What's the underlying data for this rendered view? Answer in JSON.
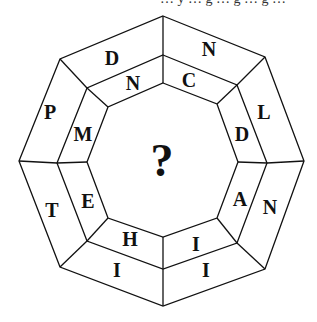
{
  "top_text": "… y … g … g … g …",
  "center": "?",
  "outer_ring": [
    {
      "pos": "top-right",
      "letter": "N"
    },
    {
      "pos": "right-upper",
      "letter": "L"
    },
    {
      "pos": "right-lower",
      "letter": "N"
    },
    {
      "pos": "bottom-right",
      "letter": "I"
    },
    {
      "pos": "bottom-left",
      "letter": "I"
    },
    {
      "pos": "left-lower",
      "letter": "T"
    },
    {
      "pos": "left-upper",
      "letter": "P"
    },
    {
      "pos": "top-left",
      "letter": "D"
    }
  ],
  "inner_ring": [
    {
      "pos": "top-right",
      "letter": "C"
    },
    {
      "pos": "right-upper",
      "letter": "D"
    },
    {
      "pos": "right-lower",
      "letter": "A"
    },
    {
      "pos": "bottom-right",
      "letter": "I"
    },
    {
      "pos": "bottom-left",
      "letter": "H"
    },
    {
      "pos": "left-lower",
      "letter": "E"
    },
    {
      "pos": "left-upper",
      "letter": "M"
    },
    {
      "pos": "top-left",
      "letter": "N"
    }
  ]
}
